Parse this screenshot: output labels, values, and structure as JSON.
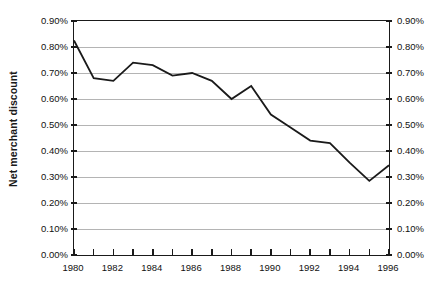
{
  "chart_data": {
    "type": "line",
    "title": "",
    "subtitle": "",
    "xlabel": "",
    "ylabel": "Net merchant discount",
    "xlim": [
      1980,
      1996
    ],
    "ylim": [
      0.0,
      0.9
    ],
    "yunit": "%",
    "grid": true,
    "grid_axis": "y",
    "legend": false,
    "legend_position": "none",
    "dual_y_axis": true,
    "y_tick_labels": [
      "0.90%",
      "0.80%",
      "0.70%",
      "0.60%",
      "0.50%",
      "0.40%",
      "0.30%",
      "0.20%",
      "0.10%",
      "0.00%"
    ],
    "y_tick_values": [
      0.9,
      0.8,
      0.7,
      0.6,
      0.5,
      0.4,
      0.3,
      0.2,
      0.1,
      0.0
    ],
    "x_tick_values": [
      1980,
      1981,
      1982,
      1983,
      1984,
      1985,
      1986,
      1987,
      1988,
      1989,
      1990,
      1991,
      1992,
      1993,
      1994,
      1995,
      1996
    ],
    "x_tick_labels": [
      "1980",
      "",
      "1982",
      "",
      "1984",
      "",
      "1986",
      "",
      "1988",
      "",
      "1990",
      "",
      "1992",
      "",
      "1994",
      "",
      "1996"
    ],
    "x": [
      1980,
      1981,
      1982,
      1983,
      1984,
      1985,
      1986,
      1987,
      1988,
      1989,
      1990,
      1991,
      1992,
      1993,
      1994,
      1995,
      1996
    ],
    "values": [
      0.825,
      0.68,
      0.67,
      0.74,
      0.73,
      0.69,
      0.7,
      0.67,
      0.6,
      0.65,
      0.54,
      0.49,
      0.44,
      0.43,
      0.355,
      0.285,
      0.345
    ],
    "series": [
      {
        "name": "Net merchant discount",
        "color": "#1a1a1a",
        "line_width": 1.8,
        "marker": "none",
        "values": [
          0.825,
          0.68,
          0.67,
          0.74,
          0.73,
          0.69,
          0.7,
          0.67,
          0.6,
          0.65,
          0.54,
          0.49,
          0.44,
          0.43,
          0.355,
          0.285,
          0.345
        ]
      }
    ],
    "annotations": []
  },
  "colors": {
    "axis": "#1a1a1a",
    "grid": "#b4b4b4",
    "line": "#1a1a1a",
    "background": "#ffffff",
    "text": "#111111"
  }
}
